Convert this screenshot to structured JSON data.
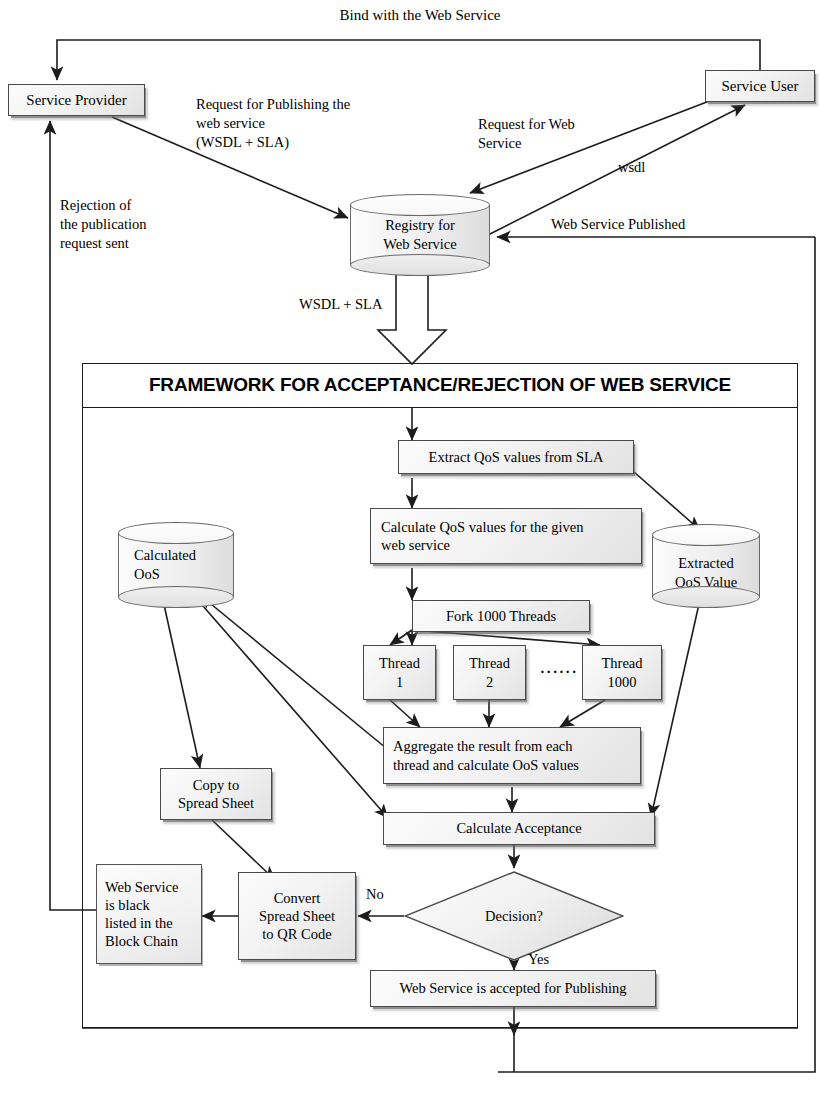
{
  "diagram": {
    "title": "Framework for Acceptance/Rejection of Web Service",
    "framework_title": "FRAMEWORK FOR ACCEPTANCE/REJECTION OF WEB SERVICE"
  },
  "actors": {
    "service_provider": "Service Provider",
    "service_user": "Service User",
    "registry_line1": "Registry for",
    "registry_line2": "Web Service"
  },
  "datastores": {
    "calculated_qos_line1": "Calculated",
    "calculated_qos_line2": "OoS",
    "extracted_qos_line1": "Extracted",
    "extracted_qos_line2": "OoS Value"
  },
  "process": {
    "extract": "Extract QoS values from SLA",
    "calculate_line1": "Calculate QoS values for the given",
    "calculate_line2": "web service",
    "fork": "Fork 1000 Threads",
    "thread1_line1": "Thread",
    "thread1_line2": "1",
    "thread2_line1": "Thread",
    "thread2_line2": "2",
    "ellipsis": "······",
    "thread1000_line1": "Thread",
    "thread1000_line2": "1000",
    "aggregate_line1": "Aggregate the result from each",
    "aggregate_line2": "thread and calculate OoS values",
    "calculate_acceptance": "Calculate Acceptance",
    "decision": "Decision?",
    "accepted": "Web Service is accepted for Publishing",
    "copy_line1": "Copy to",
    "copy_line2": "Spread Sheet",
    "convert_line1": "Convert",
    "convert_line2": "Spread Sheet",
    "convert_line3": "to QR Code",
    "blacklist_line1": "Web Service",
    "blacklist_line2": "is black",
    "blacklist_line3": "listed in the",
    "blacklist_line4": "Block Chain"
  },
  "edge_labels": {
    "bind": "Bind with the Web Service",
    "publish_line1": "Request for Publishing the",
    "publish_line2": "web service",
    "publish_line3": "(WSDL + SLA)",
    "request_web_line1": "Request for Web",
    "request_web_line2": "Service",
    "wsdl": "wsdl",
    "published": "Web Service Published",
    "rejection_line1": "Rejection of",
    "rejection_line2": "the publication",
    "rejection_line3": "request sent",
    "wsdl_sla": "WSDL + SLA",
    "no": "No",
    "yes": "Yes"
  },
  "colors": {
    "line": "#1c1c1c",
    "node_border": "#4a4a4a",
    "node_fill_light": "#fbfbfb",
    "node_fill_dark": "#e2e2e2",
    "background": "#ffffff"
  }
}
